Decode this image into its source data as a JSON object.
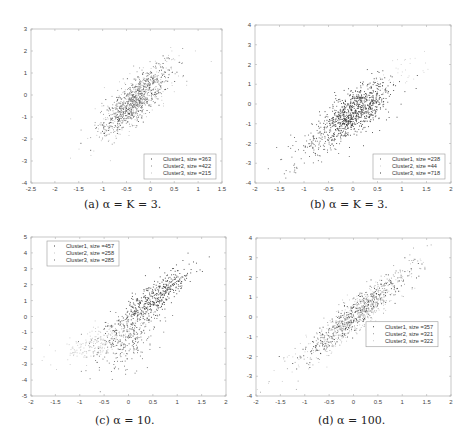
{
  "chart_data": [
    {
      "id": "a",
      "type": "scatter",
      "caption": "(a) α = K = 3.",
      "xlim": [
        -2.5,
        1.5
      ],
      "ylim": [
        -4,
        3
      ],
      "xticks": [
        -2.5,
        -2,
        -1.5,
        -1,
        -0.5,
        0,
        0.5,
        1,
        1.5
      ],
      "xtick_labels": [
        "-2.5",
        "-2",
        "-1.5",
        "-1",
        "-0.5",
        "0",
        "0.5",
        "1",
        "1.5"
      ],
      "yticks": [
        -4,
        -3,
        -2,
        -1,
        0,
        1,
        2,
        3
      ],
      "ytick_labels": [
        "-4",
        "-3",
        "-2",
        "-1",
        "0",
        "1",
        "2",
        "3"
      ],
      "grid": false,
      "legend_position": "bottom-right",
      "series": [
        {
          "name": "Cluster1, size =363",
          "size": 363,
          "color": "#3a3a3a",
          "mean": [
            -0.3,
            -0.2
          ],
          "sd": [
            0.33,
            0.75
          ],
          "corr": 0.82
        },
        {
          "name": "Cluster2, size =422",
          "size": 422,
          "color": "#8a8a8a",
          "mean": [
            -0.35,
            -0.3
          ],
          "sd": [
            0.38,
            0.85
          ],
          "corr": 0.8
        },
        {
          "name": "Cluster3, size =215",
          "size": 215,
          "color": "#c4c4c4",
          "mean": [
            -0.25,
            -0.15
          ],
          "sd": [
            0.45,
            1.0
          ],
          "corr": 0.8
        }
      ]
    },
    {
      "id": "b",
      "type": "scatter",
      "caption": "(b) α = K = 3.",
      "xlim": [
        -2,
        2
      ],
      "ylim": [
        -4,
        4
      ],
      "xticks": [
        -2,
        -1.5,
        -1,
        -0.5,
        0,
        0.5,
        1,
        1.5,
        2
      ],
      "xtick_labels": [
        "-2",
        "-1.5",
        "-1",
        "-0.5",
        "0",
        "0.5",
        "1",
        "1.5",
        "2"
      ],
      "yticks": [
        -4,
        -3,
        -2,
        -1,
        0,
        1,
        2,
        3,
        4
      ],
      "ytick_labels": [
        "-4",
        "-3",
        "-2",
        "-1",
        "0",
        "1",
        "2",
        "3",
        "4"
      ],
      "grid": false,
      "legend_position": "bottom-right",
      "series": [
        {
          "name": "Cluster1, size =238",
          "size": 238,
          "color": "#5a5a5a",
          "mean": [
            -0.55,
            -1.6
          ],
          "sd": [
            0.38,
            0.75
          ],
          "corr": 0.75
        },
        {
          "name": "Cluster2, size =44",
          "size": 44,
          "color": "#d0d0d0",
          "mean": [
            0.8,
            1.2
          ],
          "sd": [
            0.35,
            0.6
          ],
          "corr": 0.6
        },
        {
          "name": "Cluster3, size =718",
          "size": 718,
          "color": "#3a3a3a",
          "mean": [
            0.1,
            -0.25
          ],
          "sd": [
            0.32,
            0.65
          ],
          "corr": 0.55
        }
      ]
    },
    {
      "id": "c",
      "type": "scatter",
      "caption": "(c) α = 10.",
      "xlim": [
        -2,
        2
      ],
      "ylim": [
        -5,
        5
      ],
      "xticks": [
        -2,
        -1.5,
        -1,
        -0.5,
        0,
        0.5,
        1,
        1.5,
        2
      ],
      "xtick_labels": [
        "-2",
        "-1.5",
        "-1",
        "-0.5",
        "0",
        "0.5",
        "1",
        "1.5",
        "2"
      ],
      "yticks": [
        -5,
        -4,
        -3,
        -2,
        -1,
        0,
        1,
        2,
        3,
        4,
        5
      ],
      "ytick_labels": [
        "-5",
        "-4",
        "-3",
        "-2",
        "-1",
        "0",
        "1",
        "2",
        "3",
        "4",
        "5"
      ],
      "grid": false,
      "legend_position": "top-left",
      "series": [
        {
          "name": "Cluster1, size =457",
          "size": 457,
          "color": "#3a3a3a",
          "mean": [
            0.55,
            1.2
          ],
          "sd": [
            0.38,
            1.0
          ],
          "corr": 0.85
        },
        {
          "name": "Cluster2, size =258",
          "size": 258,
          "color": "#c8c8c8",
          "mean": [
            -0.6,
            -1.6
          ],
          "sd": [
            0.4,
            0.6
          ],
          "corr": 0.7
        },
        {
          "name": "Cluster3, size =285",
          "size": 285,
          "color": "#6a6a6a",
          "mean": [
            -0.05,
            -1.5
          ],
          "sd": [
            0.35,
            1.1
          ],
          "corr": 0.55
        }
      ]
    },
    {
      "id": "d",
      "type": "scatter",
      "caption": "(d) α = 100.",
      "xlim": [
        -2,
        2
      ],
      "ylim": [
        -4,
        4
      ],
      "xticks": [
        -2,
        -1.5,
        -1,
        -0.5,
        0,
        0.5,
        1,
        1.5,
        2
      ],
      "xtick_labels": [
        "-2",
        "-1.5",
        "-1",
        "-0.5",
        "0",
        "0.5",
        "1",
        "1.5",
        "2"
      ],
      "yticks": [
        -4,
        -3,
        -2,
        -1,
        0,
        1,
        2,
        3,
        4
      ],
      "ytick_labels": [
        "-4",
        "-3",
        "-2",
        "-1",
        "0",
        "1",
        "2",
        "3",
        "4"
      ],
      "grid": false,
      "legend_position": "middle-right",
      "series": [
        {
          "name": "Cluster1, size =357",
          "size": 357,
          "color": "#3a3a3a",
          "mean": [
            0.05,
            0.15
          ],
          "sd": [
            0.55,
            1.15
          ],
          "corr": 0.93
        },
        {
          "name": "Cluster2, size =321",
          "size": 321,
          "color": "#9a9a9a",
          "mean": [
            0.0,
            0.05
          ],
          "sd": [
            0.6,
            1.25
          ],
          "corr": 0.93
        },
        {
          "name": "Cluster3, size =322",
          "size": 322,
          "color": "#c8c8c8",
          "mean": [
            0.0,
            0.0
          ],
          "sd": [
            0.62,
            1.3
          ],
          "corr": 0.93
        }
      ]
    }
  ]
}
